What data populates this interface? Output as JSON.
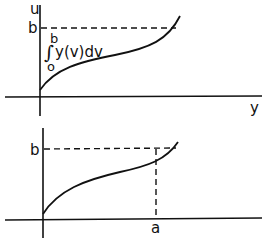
{
  "top_plot": {
    "y_axis_label": "u",
    "x_axis_label": "y",
    "level_label": "b",
    "integral": {
      "symbol": "∫",
      "upper_limit": "b",
      "lower_limit": "o",
      "integrand": "y(v)dv"
    }
  },
  "bottom_plot": {
    "level_label": "b",
    "x_marker_label": "a"
  },
  "colors": {
    "ink": "#111111",
    "background": "#ffffff"
  }
}
